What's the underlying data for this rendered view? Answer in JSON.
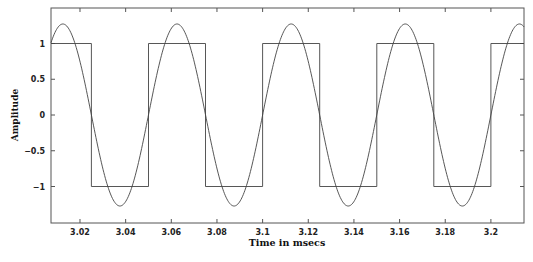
{
  "chart_data": {
    "type": "line",
    "title": "",
    "xlabel": "Time in msecs",
    "ylabel": "Amplitude",
    "xlim": [
      3.0073,
      3.2145
    ],
    "ylim": [
      -1.5,
      1.5
    ],
    "grid": false,
    "legend": null,
    "x_ticks": [
      3.02,
      3.04,
      3.06,
      3.08,
      3.1,
      3.12,
      3.14,
      3.16,
      3.18,
      3.2
    ],
    "x_tick_labels": [
      "3.02",
      "3.04",
      "3.06",
      "3.08",
      "3.1",
      "3.12",
      "3.14",
      "3.16",
      "3.18",
      "3.2"
    ],
    "y_ticks": [
      1,
      0.5,
      0,
      -0.5,
      -1
    ],
    "y_tick_labels": [
      "1",
      "0.5",
      "0",
      "-0.5",
      "-1"
    ],
    "series": [
      {
        "name": "Square wave",
        "kind": "square",
        "amplitude": 1,
        "period_msec": 0.05,
        "rising_edges": [
          3.05,
          3.1,
          3.15,
          3.2
        ],
        "falling_edges": [
          3.025,
          3.075,
          3.125,
          3.175
        ],
        "color": "#444444"
      },
      {
        "name": "Fundamental sine",
        "kind": "sine",
        "amplitude": 1.273,
        "period_msec": 0.05,
        "phase_zero_msec": 3.05,
        "color": "#444444"
      }
    ]
  },
  "labels": {
    "xlabel": "Time in msecs",
    "ylabel": "Amplitude"
  }
}
